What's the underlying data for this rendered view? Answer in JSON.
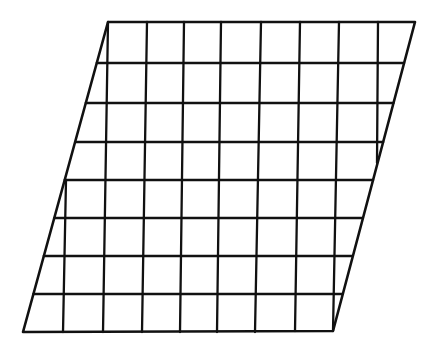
{
  "diagram": {
    "type": "sheared-grid",
    "stroke_color": "#111111",
    "background_color": "#ffffff",
    "outline_stroke_width": 2.6,
    "grid_stroke_width": 2.3,
    "outline": {
      "top_left": [
        108,
        22
      ],
      "top_right": [
        415,
        22
      ],
      "bottom_right": [
        333,
        331
      ],
      "bottom_left": [
        23,
        332
      ]
    },
    "horizontal_lines_y": [
      63,
      103,
      142,
      180,
      218,
      256,
      294
    ],
    "vertical_lines": [
      {
        "x_top": 66,
        "y_top": 180,
        "x_bottom": 63,
        "y_bottom": 332
      },
      {
        "x_top": 108,
        "y_top": 22,
        "x_bottom": 103,
        "y_bottom": 332
      },
      {
        "x_top": 147,
        "y_top": 22,
        "x_bottom": 142,
        "y_bottom": 332
      },
      {
        "x_top": 184,
        "y_top": 22,
        "x_bottom": 180,
        "y_bottom": 332
      },
      {
        "x_top": 221,
        "y_top": 22,
        "x_bottom": 217,
        "y_bottom": 332
      },
      {
        "x_top": 261,
        "y_top": 22,
        "x_bottom": 255,
        "y_bottom": 332
      },
      {
        "x_top": 300,
        "y_top": 22,
        "x_bottom": 295,
        "y_bottom": 331
      },
      {
        "x_top": 339,
        "y_top": 22,
        "x_bottom": 333,
        "y_bottom": 331
      },
      {
        "x_top": 378,
        "y_top": 22,
        "x_bottom": 377,
        "y_bottom": 163
      }
    ],
    "rows": 8,
    "columns": 8
  }
}
